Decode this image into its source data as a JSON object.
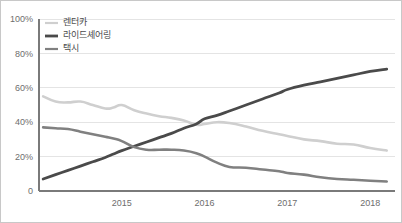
{
  "chart_data": {
    "type": "line",
    "title": "",
    "subtitle": "",
    "xlabel": "",
    "ylabel": "",
    "xlim": [
      2014.0,
      2018.3
    ],
    "ylim": [
      0,
      100
    ],
    "grid": true,
    "legend_position": "top-left",
    "y_ticks": [
      "0",
      "20%",
      "40%",
      "60%",
      "80%",
      "100%"
    ],
    "y_tick_values": [
      0,
      20,
      40,
      60,
      80,
      100
    ],
    "x_ticks": [
      "2015",
      "2016",
      "2017",
      "2018"
    ],
    "x_tick_values": [
      2015,
      2016,
      2017,
      2018
    ],
    "x": [
      2014.05,
      2014.2,
      2014.35,
      2014.5,
      2014.65,
      2014.8,
      2014.9,
      2015.0,
      2015.15,
      2015.3,
      2015.45,
      2015.6,
      2015.75,
      2015.9,
      2016.0,
      2016.15,
      2016.3,
      2016.5,
      2016.7,
      2016.9,
      2017.0,
      2017.2,
      2017.4,
      2017.6,
      2017.8,
      2018.0,
      2018.2
    ],
    "series": [
      {
        "name": "렌터카",
        "color": "#cfcfcf",
        "width": 2.6,
        "values": [
          55.0,
          52.0,
          51.5,
          52.0,
          50.0,
          48.0,
          48.5,
          50.0,
          47.0,
          45.0,
          43.5,
          42.5,
          41.0,
          38.5,
          39.0,
          40.0,
          39.5,
          37.5,
          35.0,
          33.0,
          32.0,
          30.0,
          29.0,
          27.5,
          27.0,
          25.0,
          23.5
        ]
      },
      {
        "name": "라이드셰어링",
        "color": "#4a4a4a",
        "width": 2.8,
        "values": [
          7.0,
          9.5,
          12.0,
          14.5,
          17.0,
          19.5,
          21.5,
          23.5,
          26.0,
          28.5,
          31.0,
          33.5,
          36.5,
          39.0,
          42.0,
          44.0,
          46.5,
          50.0,
          53.5,
          57.0,
          59.0,
          61.5,
          63.5,
          65.5,
          67.5,
          69.5,
          70.8
        ]
      },
      {
        "name": "택시",
        "color": "#808080",
        "width": 2.6,
        "values": [
          37.0,
          36.5,
          36.0,
          34.5,
          33.0,
          31.5,
          30.5,
          29.0,
          25.5,
          24.0,
          24.0,
          24.0,
          23.5,
          22.0,
          20.0,
          16.5,
          14.0,
          13.5,
          12.5,
          11.5,
          10.5,
          9.5,
          8.0,
          7.0,
          6.5,
          6.0,
          5.5
        ]
      }
    ]
  },
  "legend": {
    "items": [
      {
        "label": "렌터카",
        "color": "#cfcfcf"
      },
      {
        "label": "라이드셰어링",
        "color": "#4a4a4a"
      },
      {
        "label": "택시",
        "color": "#808080"
      }
    ]
  },
  "axes": {
    "grid_color": "#e4e4e4",
    "axis_color": "#7a7a7a",
    "tick_text_color": "#6e6e6e"
  }
}
